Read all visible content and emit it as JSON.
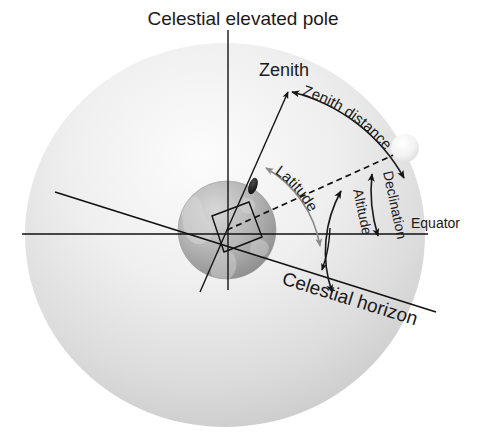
{
  "figure": {
    "title": "Celestial elevated pole",
    "type": "astronomical-coordinate-diagram",
    "background_color": "#ffffff",
    "text_color": "#1a1a1a"
  },
  "labels": {
    "celestial_elevated_pole": "Celestial elevated pole",
    "zenith": "Zenith",
    "zenith_distance": "Zenith distance",
    "latitude": "Latitude",
    "declination": "Declination",
    "altitude": "Altitude",
    "equator": "Equator",
    "celestial_horizon": "Celestial horizon"
  },
  "objects": {
    "celestial_sphere": {
      "name": "celestial sphere",
      "center_x": 225,
      "center_y": 235,
      "radius_x": 200,
      "radius_y": 192,
      "fill_light": "#fdfdfd",
      "fill_dark": "#c9c9c9"
    },
    "earth": {
      "name": "Earth globe",
      "center_x": 227,
      "center_y": 230,
      "radius": 49,
      "fill_light": "#d4d4d4",
      "fill_dark": "#8d8d8d"
    },
    "star": {
      "name": "celestial body",
      "center_x": 405,
      "center_y": 148,
      "radius": 14,
      "fill": "#f2f2f2"
    },
    "observer": {
      "name": "observer position",
      "x": 253,
      "y": 186,
      "fill": "#141414"
    }
  },
  "lines": {
    "polar_axis": {
      "label": "polar axis",
      "x1": 228,
      "y1": 30,
      "x2": 228,
      "y2": 286
    },
    "equator_line": {
      "label": "equator",
      "x1": 22,
      "y1": 234,
      "x2": 428,
      "y2": 234
    },
    "celestial_horizon_line": {
      "label": "celestial horizon",
      "x1": 55,
      "y1": 192,
      "x2": 432,
      "y2": 310
    },
    "zenith_ray": {
      "label": "zenith direction",
      "x1": 227,
      "y1": 230,
      "x2": 283,
      "y2": 96
    },
    "declination_ray": {
      "label": "direction to star",
      "x1": 227,
      "y1": 230,
      "x2": 400,
      "y2": 152
    }
  },
  "arcs": {
    "zenith_distance": {
      "label": "Zenith distance",
      "from": "zenith",
      "to": "star"
    },
    "latitude": {
      "label": "Latitude",
      "from": "observer",
      "to": "equator"
    },
    "declination": {
      "label": "Declination",
      "from": "star",
      "to": "equator"
    },
    "altitude": {
      "label": "Altitude",
      "from": "star-direction",
      "to": "horizon"
    }
  },
  "markers": {
    "right_angle": {
      "label": "right angle between zenith ray and horizon"
    }
  }
}
